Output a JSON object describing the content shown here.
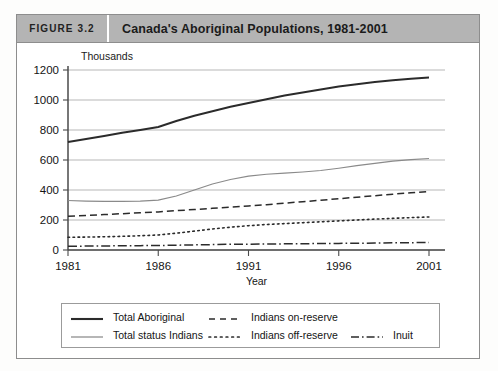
{
  "figure": {
    "number_label": "FIGURE 3.2",
    "title": "Canada's Aboriginal Populations, 1981-2001"
  },
  "chart_data": {
    "type": "line",
    "title": "Canada's Aboriginal Populations, 1981-2001",
    "unit_label": "Thousands",
    "xlabel": "Year",
    "ylabel": "",
    "xlim": [
      1981,
      2001
    ],
    "ylim": [
      0,
      1200
    ],
    "ytick_labels": [
      "1200",
      "1000",
      "800",
      "600",
      "400",
      "200",
      "0"
    ],
    "yticks": [
      1200,
      1000,
      800,
      600,
      400,
      200,
      0
    ],
    "xtick_labels": [
      "1981",
      "1986",
      "1991",
      "1996",
      "2001"
    ],
    "xticks": [
      1981,
      1986,
      1991,
      1996,
      2001
    ],
    "grid": "horizontal",
    "legend_position": "below-plot",
    "x": [
      1981,
      1982,
      1983,
      1984,
      1985,
      1986,
      1987,
      1988,
      1989,
      1990,
      1991,
      1992,
      1993,
      1994,
      1995,
      1996,
      1997,
      1998,
      1999,
      2000,
      2001
    ],
    "series": [
      {
        "name": "Total Aboriginal",
        "style": "solid-thick",
        "color": "#2b2b2b",
        "values": [
          720,
          740,
          760,
          782,
          800,
          820,
          860,
          895,
          925,
          955,
          980,
          1005,
          1030,
          1050,
          1070,
          1090,
          1105,
          1120,
          1132,
          1142,
          1150
        ]
      },
      {
        "name": "Total status Indians",
        "style": "solid-thin-gray",
        "color": "#8a8a8a",
        "values": [
          330,
          326,
          324,
          324,
          326,
          332,
          360,
          400,
          440,
          470,
          492,
          505,
          512,
          520,
          530,
          545,
          562,
          578,
          592,
          602,
          610
        ]
      },
      {
        "name": "Indians on-reserve",
        "style": "dashed",
        "color": "#2b2b2b",
        "values": [
          225,
          230,
          236,
          242,
          248,
          254,
          262,
          270,
          278,
          286,
          294,
          302,
          312,
          322,
          332,
          342,
          352,
          362,
          372,
          382,
          390
        ]
      },
      {
        "name": "Indians off-reserve",
        "style": "dotted",
        "color": "#2b2b2b",
        "values": [
          85,
          86,
          88,
          91,
          95,
          100,
          112,
          126,
          140,
          152,
          162,
          170,
          176,
          182,
          188,
          194,
          200,
          206,
          211,
          216,
          220
        ]
      },
      {
        "name": "Inuit",
        "style": "dash-dot",
        "color": "#2b2b2b",
        "values": [
          25,
          26,
          27,
          28,
          29,
          30,
          32,
          34,
          36,
          38,
          39,
          40,
          41,
          42,
          43,
          44,
          45,
          46,
          48,
          49,
          50
        ]
      }
    ]
  },
  "legend": {
    "entries": [
      {
        "label": "Total Aboriginal",
        "style": "solid-thick"
      },
      {
        "label": "Total status Indians",
        "style": "solid-thin-gray"
      },
      {
        "label": "Indians on-reserve",
        "style": "dashed"
      },
      {
        "label": "Indians off-reserve",
        "style": "dotted"
      },
      {
        "label": "Inuit",
        "style": "dash-dot"
      }
    ]
  }
}
